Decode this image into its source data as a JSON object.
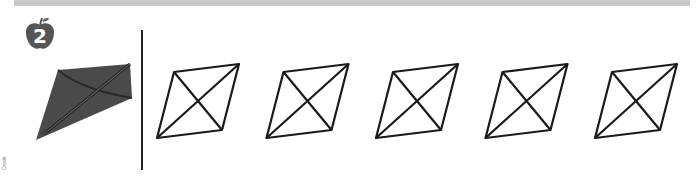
{
  "exercise": {
    "number": "2",
    "badge_icon": "apple-icon",
    "badge_color": "#555555",
    "example_image": "kite-icon",
    "kite_color": "#4a4a4a",
    "shape_count": 5,
    "shape_type": "rhombus-with-diagonals",
    "shape_stroke": "#1a1a1a"
  },
  "header_bar_color": "#c9c9c9",
  "side_credit": "Credit"
}
